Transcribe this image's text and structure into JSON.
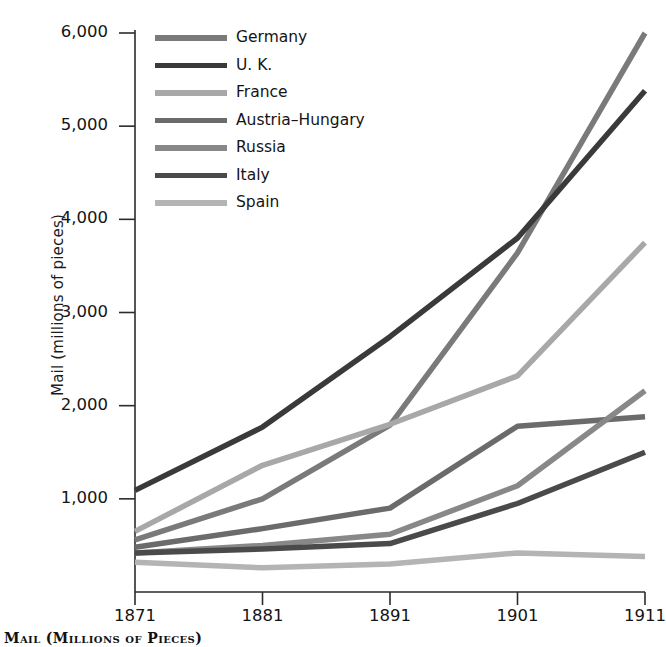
{
  "chart_data": {
    "type": "line",
    "title": "",
    "caption": "Mail (Millions of Pieces)",
    "xlabel": "",
    "ylabel": "Mail (millions of pieces)",
    "x": [
      1871,
      1881,
      1891,
      1901,
      1911
    ],
    "xticklabels": [
      "1871",
      "1881",
      "1891",
      "1901",
      "1911"
    ],
    "yticks": [
      1000,
      2000,
      3000,
      4000,
      5000,
      6000
    ],
    "yticklabels": [
      "1,000",
      "2,000",
      "3,000",
      "4,000",
      "5,000",
      "6,000"
    ],
    "xlim": [
      1871,
      1911
    ],
    "ylim": [
      0,
      6050
    ],
    "grid": false,
    "legend_position": "upper-center-left",
    "series": [
      {
        "name": "Germany",
        "color": "#7a7a7a",
        "values": [
          560,
          1000,
          1790,
          3640,
          6000
        ]
      },
      {
        "name": "U. K.",
        "color": "#3a3a3a",
        "values": [
          1090,
          1770,
          2740,
          3800,
          5380
        ]
      },
      {
        "name": "France",
        "color": "#a8a8a8",
        "values": [
          650,
          1360,
          1800,
          2320,
          3750
        ]
      },
      {
        "name": "Austria–Hungary",
        "color": "#6b6b6b",
        "values": [
          480,
          680,
          900,
          1780,
          1880
        ]
      },
      {
        "name": "Russia",
        "color": "#888888",
        "values": [
          420,
          500,
          620,
          1140,
          2160
        ]
      },
      {
        "name": "Italy",
        "color": "#4a4a4a",
        "values": [
          420,
          460,
          520,
          950,
          1500
        ]
      },
      {
        "name": "Spain",
        "color": "#b4b4b4",
        "values": [
          320,
          260,
          300,
          420,
          380
        ]
      }
    ]
  }
}
